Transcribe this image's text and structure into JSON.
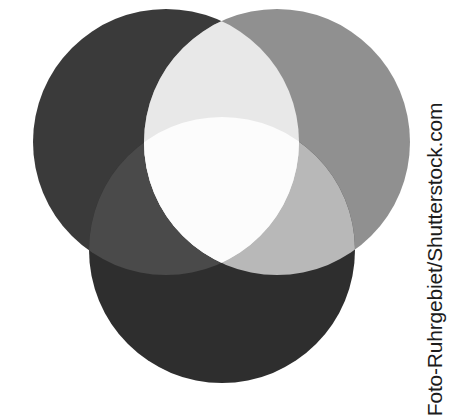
{
  "image": {
    "title": "Three overlapping circles grayscale Venn diagram",
    "background_color": "#ffffff",
    "width": 456,
    "height": 408
  },
  "watermark": {
    "text": "Foto-Ruhrgebiet/Shutterstock.com",
    "contributor": "Foto-Ruhrgebiet",
    "agency": "Shutterstock.com",
    "color": "#1c1c1c",
    "orientation": "vertical-bottom-to-top",
    "position": "right-edge"
  },
  "diagram": {
    "type": "venn",
    "set_count": 3,
    "blend_mode": "additive-light-mixing",
    "circles": [
      {
        "id": "circle-top-left",
        "label": "top-left",
        "cx": 166,
        "cy": 142,
        "r": 133,
        "color": "#3a3a3a"
      },
      {
        "id": "circle-top-right",
        "label": "top-right",
        "cx": 277,
        "cy": 142,
        "r": 133,
        "color": "#909090"
      },
      {
        "id": "circle-bottom",
        "label": "bottom",
        "cx": 222,
        "cy": 250,
        "r": 133,
        "color": "#2e2e2e"
      }
    ],
    "regions": [
      {
        "id": "region-top-left-only",
        "label": "top-left only",
        "color": "#3a3a3a"
      },
      {
        "id": "region-top-right-only",
        "label": "top-right only",
        "color": "#909090"
      },
      {
        "id": "region-bottom-only",
        "label": "bottom only",
        "color": "#2e2e2e"
      },
      {
        "id": "region-top-pair",
        "label": "top-left + top-right",
        "color": "#e8e8e8"
      },
      {
        "id": "region-left-bottom-pair",
        "label": "top-left + bottom",
        "color": "#4a4a4a"
      },
      {
        "id": "region-right-bottom-pair",
        "label": "top-right + bottom",
        "color": "#b8b8b8"
      },
      {
        "id": "region-center",
        "label": "all three",
        "color": "#fcfcfc"
      }
    ]
  }
}
